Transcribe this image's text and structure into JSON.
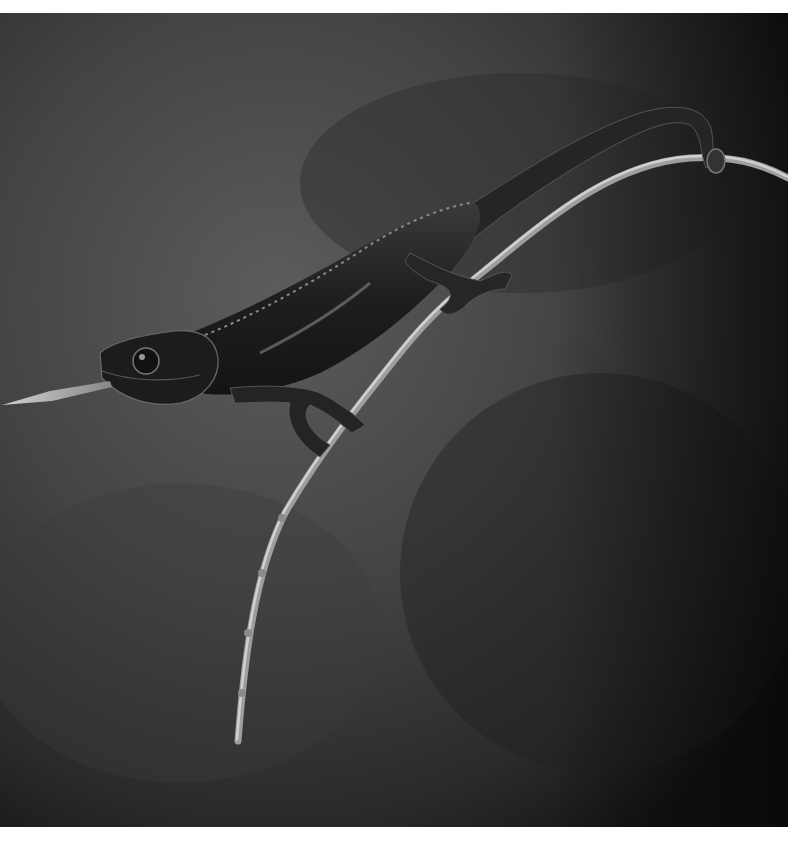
{
  "image": {
    "alt": "Black and white photograph of a chameleon perched on a thin curving twig, extending its tongue to the left against a dark blurred background",
    "subjects": [
      "chameleon",
      "twig",
      "tongue"
    ],
    "colors": {
      "background_light": "#5a5a5a",
      "background_dark": "#141414",
      "body": "#1e1e1e",
      "highlight": "#9a9a9a",
      "twig": "#b8b8b8"
    }
  }
}
